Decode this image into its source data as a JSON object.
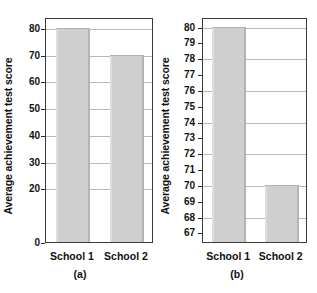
{
  "figure": {
    "ylabel": "Average achievement test score"
  },
  "chart_data": [
    {
      "type": "bar",
      "panel": "(a)",
      "title": "",
      "xlabel": "",
      "ylabel": "Average achievement test score",
      "categories": [
        "School 1",
        "School 2"
      ],
      "values": [
        80,
        70
      ],
      "ylim": [
        0,
        84
      ],
      "yticks": [
        0,
        20,
        30,
        40,
        50,
        60,
        70,
        80
      ],
      "ytick_labels": [
        "0",
        "20",
        "30",
        "40",
        "50",
        "60",
        "70",
        "80"
      ],
      "gridlines": [
        20,
        30,
        40,
        50,
        60,
        70,
        80
      ],
      "grid": true,
      "legend": "none",
      "bar_color": "#cfcfcf"
    },
    {
      "type": "bar",
      "panel": "(b)",
      "title": "",
      "xlabel": "",
      "ylabel": "Average achievement test score",
      "categories": [
        "School 1",
        "School 2"
      ],
      "values": [
        80,
        70
      ],
      "ylim": [
        66.4,
        80.6
      ],
      "yticks": [
        67,
        68,
        69,
        70,
        71,
        72,
        73,
        74,
        75,
        76,
        77,
        78,
        79,
        80
      ],
      "ytick_labels": [
        "67",
        "68",
        "69",
        "70",
        "71",
        "72",
        "73",
        "74",
        "75",
        "76",
        "77",
        "78",
        "79",
        "80"
      ],
      "gridlines": [
        68,
        70,
        72,
        74,
        76,
        78,
        80
      ],
      "grid": true,
      "legend": "none",
      "bar_color": "#cfcfcf"
    }
  ],
  "panel_a": {
    "caption": "(a)",
    "ylabel": "Average achievement test score",
    "cat0": "School 1",
    "cat1": "School 2"
  },
  "panel_b": {
    "caption": "(b)",
    "ylabel": "Average achievement test score",
    "cat0": "School 1",
    "cat1": "School 2"
  }
}
